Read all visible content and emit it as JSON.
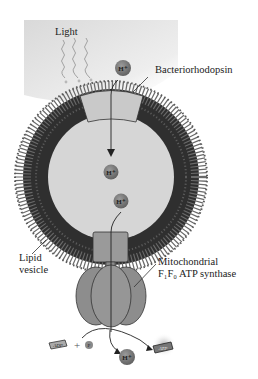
{
  "labels": {
    "light": "Light",
    "bacteriorhodopsin": "Bacteriorhodopsin",
    "lipid_vesicle_line1": "Lipid",
    "lipid_vesicle_line2": "vesicle",
    "synthase_line1": "Mitochondrial",
    "synthase_line2": "F₁F₀ ATP synthase"
  },
  "molecules": {
    "proton": "H⁺",
    "adp": "ADP",
    "plus": "+",
    "phosphate": "P",
    "atp": "ATP"
  },
  "colors": {
    "light_bg": "#e6e6e6",
    "membrane": "#2e2e2e",
    "vesicle_interior": "#d6d6d6",
    "protein": "#b5b5b5",
    "synthase": "#8a8a8a",
    "proton_ball": "#7d7d7d"
  }
}
